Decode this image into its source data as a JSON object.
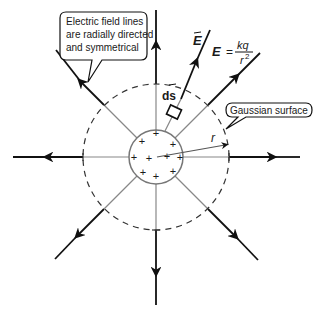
{
  "diagram": {
    "callouts": {
      "field_lines": [
        "Electric field lines",
        "are radially directed",
        "and symmetrical"
      ],
      "gaussian_surface": "Gaussian surface"
    },
    "labels": {
      "E_vector": "E",
      "ds_vector": "ds",
      "radius": "r",
      "formula_lhs": "E",
      "formula_eq": "=",
      "formula_num": "kq",
      "formula_den": "r",
      "formula_den_exp": "2"
    },
    "charge_sign": "+",
    "colors": {
      "field_line": "#111111",
      "inner_line": "#888888",
      "surface": "#333333",
      "charge_sphere": "#777777"
    }
  }
}
